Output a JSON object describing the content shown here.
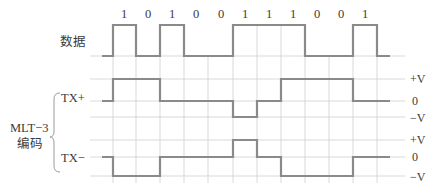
{
  "diagram": {
    "title_label_data": "数据",
    "group_label_line1": "MLT−3",
    "group_label_line2": "编码",
    "tx_plus_label": "TX+",
    "tx_minus_label": "TX−",
    "bits": [
      "1",
      "0",
      "1",
      "0",
      "0",
      "1",
      "1",
      "1",
      "0",
      "0",
      "1"
    ],
    "levels_tx_plus": {
      "high": "+V",
      "zero": "0",
      "low": "−V"
    },
    "levels_tx_minus": {
      "high": "+V",
      "zero": "0",
      "low": "−V"
    },
    "signals": {
      "data": "low,1,0,1,0,0,1,1,1,0,0,1,low",
      "tx_plus_states": [
        "0",
        "+V",
        "+V",
        "0",
        "0",
        "0",
        "−V",
        "0",
        "+V",
        "+V",
        "+V",
        "0",
        "0"
      ],
      "tx_minus_states": [
        "0",
        "−V",
        "−V",
        "0",
        "0",
        "0",
        "+V",
        "0",
        "−V",
        "−V",
        "−V",
        "0",
        "0"
      ]
    },
    "colors": {
      "signal": "#8a8a8a",
      "grid": "#cfcfcf",
      "text": "#3a3a3a"
    }
  }
}
